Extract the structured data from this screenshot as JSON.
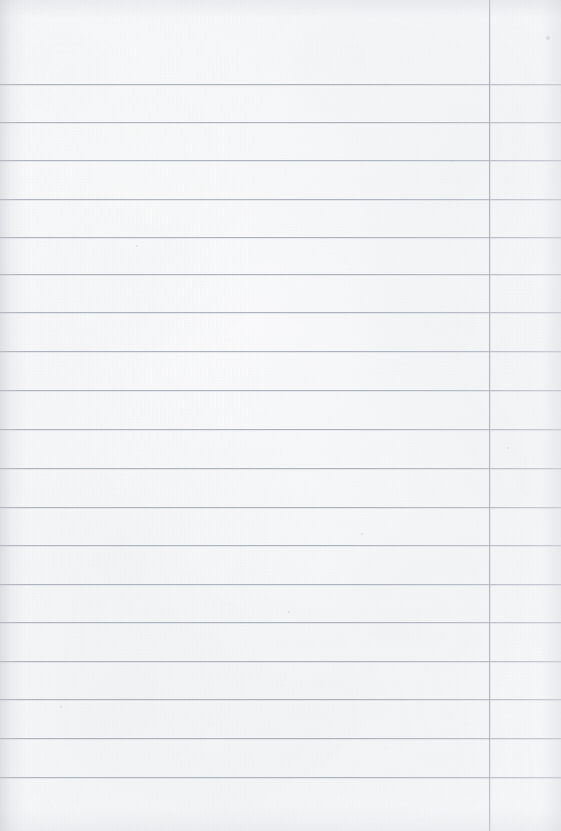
{
  "document": {
    "kind": "scanned-lined-notebook-page",
    "content_text": "",
    "page_width": 561,
    "page_height": 831,
    "paper_color": "#fbfcfc",
    "rule_color": "#acb2ba",
    "margin_rule_color": "#a6acb4"
  },
  "ruling": {
    "first_line_y": 84,
    "last_line_y": 777,
    "line_spacing": 38.5,
    "line_count": 19,
    "horizontal_line_y": [
      84,
      122,
      160,
      199,
      237,
      274,
      312,
      351,
      390,
      429,
      468,
      507,
      545,
      584,
      622,
      661,
      699,
      738,
      777
    ],
    "margin_line_x": 489,
    "margin_line_top": 0,
    "margin_line_bottom": 831
  },
  "specks": [
    {
      "x": 548,
      "y": 38,
      "r": 1.6
    },
    {
      "x": 137,
      "y": 246,
      "r": 1.2
    },
    {
      "x": 362,
      "y": 534,
      "r": 1.3
    },
    {
      "x": 61,
      "y": 707,
      "r": 1.1
    },
    {
      "x": 452,
      "y": 161,
      "r": 1.0
    },
    {
      "x": 289,
      "y": 612,
      "r": 1.2
    },
    {
      "x": 508,
      "y": 448,
      "r": 1.0
    }
  ]
}
